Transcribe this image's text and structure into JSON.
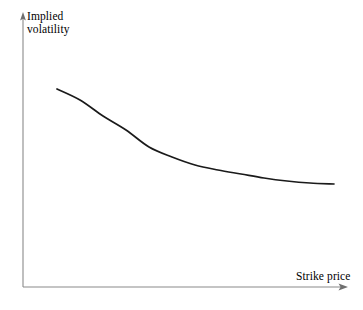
{
  "figure": {
    "background_color": "#ffffff",
    "axis_color": "#8a8a8a",
    "curve_color": "#1a1a1a"
  },
  "chart_data": {
    "type": "line",
    "title": "",
    "subtitle": "",
    "xlabel": "Strike price",
    "ylabel": "Implied volatility",
    "ylabel_lines": [
      "Implied",
      "volatility"
    ],
    "grid": false,
    "legend": null,
    "legend_position": "none",
    "xlim": [
      0,
      1
    ],
    "ylim": [
      0,
      1
    ],
    "xticks": [],
    "yticks": [],
    "xticklabels": [],
    "yticklabels": [],
    "annotations": [],
    "axes": {
      "x_axis_arrow": true,
      "y_axis_arrow": true,
      "x_axis_y_px": 287,
      "y_axis_x_px": 23,
      "x_axis_start_px": 23,
      "x_axis_end_px": 347,
      "y_axis_top_px": 14,
      "y_axis_bottom_px": 287
    },
    "series": [
      {
        "name": "Implied volatility skew",
        "description": "Monotonically decreasing convex curve (volatility skew) flattening at high strikes",
        "x": [
          0.105,
          0.175,
          0.245,
          0.315,
          0.385,
          0.455,
          0.525,
          0.595,
          0.665,
          0.735,
          0.805,
          0.875,
          0.96
        ],
        "y": [
          0.72,
          0.655,
          0.592,
          0.532,
          0.477,
          0.428,
          0.386,
          0.352,
          0.325,
          0.305,
          0.292,
          0.284,
          0.28
        ],
        "points_px": [
          [
            57,
            89
          ],
          [
            80,
            100
          ],
          [
            103,
            116
          ],
          [
            126,
            130
          ],
          [
            149,
            147
          ],
          [
            172,
            157
          ],
          [
            195,
            165
          ],
          [
            218,
            170
          ],
          [
            241,
            174
          ],
          [
            264,
            178
          ],
          [
            287,
            181
          ],
          [
            310,
            183
          ],
          [
            334,
            184
          ]
        ]
      }
    ]
  },
  "labels": {
    "y_axis_line1": "Implied",
    "y_axis_line2": "volatility",
    "x_axis": "Strike price"
  }
}
